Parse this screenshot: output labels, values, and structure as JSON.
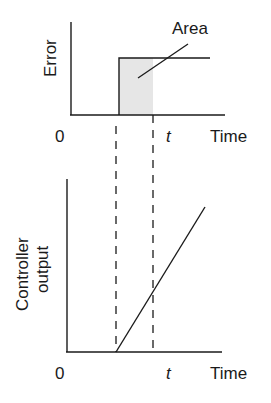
{
  "diagram": {
    "type": "integral-action-illustration",
    "top_panel": {
      "y_label": "Error",
      "x_label": "Time",
      "origin_label": "0",
      "time_marker_label": "t",
      "annotation": "Area",
      "description": "Step change in error starting at a time after 0; shaded area under the step up to time t"
    },
    "bottom_panel": {
      "y_label_line1": "Controller",
      "y_label_line2": "output",
      "x_label": "Time",
      "origin_label": "0",
      "time_marker_label": "t",
      "description": "Controller output ramps linearly from the moment the step error begins"
    },
    "colors": {
      "line": "#1a1a1a",
      "shaded_area": "#e6e6e6",
      "background": "#ffffff"
    }
  }
}
